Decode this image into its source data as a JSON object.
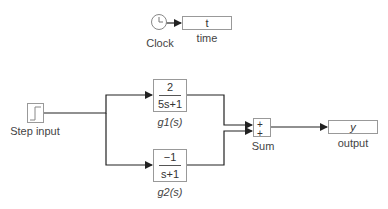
{
  "blocks": {
    "clock": {
      "label": "Clock",
      "icon": "clock-icon"
    },
    "time": {
      "value": "t",
      "label": "time"
    },
    "step": {
      "label": "Step input",
      "icon": "step-icon"
    },
    "g1": {
      "numerator": "2",
      "denominator": "5s+1",
      "label": "g1(s)"
    },
    "g2": {
      "numerator": "−1",
      "denominator": "s+1",
      "label": "g2(s)"
    },
    "sum": {
      "sign1": "+",
      "sign2": "+",
      "label": "Sum"
    },
    "output": {
      "value": "y",
      "label": "output"
    }
  },
  "colors": {
    "wire": "#222222",
    "block_border": "#999999"
  }
}
